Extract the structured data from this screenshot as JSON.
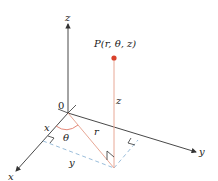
{
  "diagram": {
    "point_label": "P(r, θ, z)",
    "origin_label": "0",
    "axes": {
      "x": "x",
      "y": "y",
      "z": "z"
    },
    "segment_labels": {
      "x_component": "x",
      "y_component": "y",
      "radius": "r",
      "height": "z",
      "angle": "θ"
    },
    "colors": {
      "axis": "#333333",
      "point": "#d9412b",
      "radius_line": "#e8a896",
      "dashed_projection": "#8fb6d6",
      "angle_arc": "#e07a6a",
      "background": "#ffffff"
    }
  }
}
